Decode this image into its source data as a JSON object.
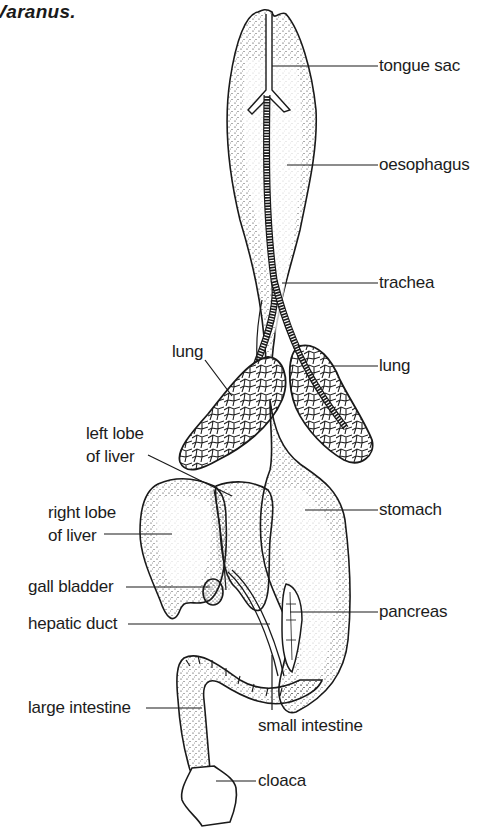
{
  "figure": {
    "title": "Varanus."
  },
  "labels": {
    "tongue_sac": "tongue sac",
    "oesophagus": "oesophagus",
    "trachea": "trachea",
    "lung_right": "lung",
    "lung_left": "lung",
    "left_lobe_line1": "left lobe",
    "left_lobe_line2": "of liver",
    "right_lobe_line1": "right lobe",
    "right_lobe_line2": "of liver",
    "stomach": "stomach",
    "gall_bladder": "gall bladder",
    "pancreas": "pancreas",
    "hepatic_duct": "hepatic duct",
    "large_intestine": "large intestine",
    "small_intestine": "small intestine",
    "cloaca": "cloaca"
  },
  "colors": {
    "ink": "#1a1a1a",
    "background": "#ffffff"
  }
}
